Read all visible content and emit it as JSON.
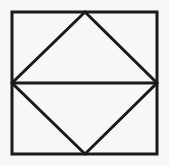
{
  "figure": {
    "title": "Square with inscribed rhombus and horizontal midline",
    "kind": "geometric-line-drawing",
    "canvas": {
      "width": 169,
      "height": 165,
      "background_color": "#f7f7f5",
      "outer_margin_color": "#ffffff"
    },
    "style": {
      "stroke_color": "#1a1a1a",
      "stroke_width": 3,
      "fill_color": "none",
      "line_cap": "butt",
      "line_join": "miter"
    },
    "square": {
      "name": "outer-square",
      "left": 12,
      "top": 12,
      "right": 157,
      "bottom": 154,
      "width": 145,
      "height": 142
    },
    "points": {
      "top_left": [
        12,
        12
      ],
      "top_right": [
        157,
        12
      ],
      "bottom_right": [
        157,
        154
      ],
      "bottom_left": [
        12,
        154
      ],
      "top_apex": [
        85,
        12
      ],
      "right_vertex": [
        157,
        83
      ],
      "bottom_apex": [
        85,
        154
      ],
      "left_vertex": [
        12,
        83
      ]
    },
    "shapes": [
      {
        "name": "outer-square",
        "type": "rect",
        "label": "Outer square border",
        "points": [
          [
            12,
            12
          ],
          [
            157,
            12
          ],
          [
            157,
            154
          ],
          [
            12,
            154
          ]
        ]
      },
      {
        "name": "inscribed-rhombus",
        "type": "polygon",
        "label": "Inscribed rhombus (diamond)",
        "points": [
          [
            85,
            12
          ],
          [
            157,
            83
          ],
          [
            85,
            154
          ],
          [
            12,
            83
          ]
        ]
      },
      {
        "name": "horizontal-midline",
        "type": "line",
        "label": "Horizontal midline across square",
        "points": [
          [
            12,
            83
          ],
          [
            157,
            83
          ]
        ]
      }
    ],
    "regions": [
      {
        "name": "upper-left-corner-triangle",
        "label": "Upper left corner triangle"
      },
      {
        "name": "upper-right-corner-triangle",
        "label": "Upper right corner triangle"
      },
      {
        "name": "upper-rhombus-triangle",
        "label": "Upper half of rhombus"
      },
      {
        "name": "lower-left-corner-triangle",
        "label": "Lower left corner triangle"
      },
      {
        "name": "lower-right-corner-triangle",
        "label": "Lower right corner triangle"
      },
      {
        "name": "lower-rhombus-triangle",
        "label": "Lower half of rhombus"
      }
    ]
  }
}
